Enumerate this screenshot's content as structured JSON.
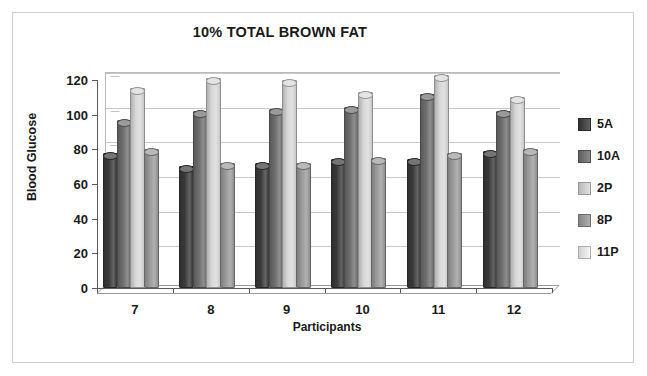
{
  "chart_data": {
    "type": "bar",
    "title": "10% TOTAL BROWN FAT",
    "xlabel": "Participants",
    "ylabel": "Blood Glucose",
    "categories": [
      "7",
      "8",
      "9",
      "10",
      "11",
      "12"
    ],
    "yticks": [
      "0",
      "20",
      "40",
      "60",
      "80",
      "100",
      "120"
    ],
    "ylim": [
      0,
      120
    ],
    "grid": true,
    "legend_position": "right",
    "series": [
      {
        "name": "5A",
        "color": "#3a3a3a",
        "values": [
          77,
          69,
          71,
          73,
          73,
          78
        ]
      },
      {
        "name": "10A",
        "color": "#6e6e6e",
        "values": [
          96,
          101,
          102,
          103,
          111,
          101
        ]
      },
      {
        "name": "2P",
        "color": "#d9d9d9",
        "values": [
          114,
          120,
          119,
          112,
          122,
          109
        ]
      },
      {
        "name": "8P",
        "color": "#9b9b9b",
        "values": [
          79,
          71,
          71,
          74,
          77,
          79
        ]
      },
      {
        "name": "11P",
        "color": "#f5f5f5",
        "values": [
          0,
          0,
          0,
          0,
          0,
          0
        ]
      }
    ]
  },
  "legend": {
    "items": [
      {
        "label": "5A"
      },
      {
        "label": "10A"
      },
      {
        "label": "2P"
      },
      {
        "label": "8P"
      },
      {
        "label": "11P"
      }
    ]
  }
}
